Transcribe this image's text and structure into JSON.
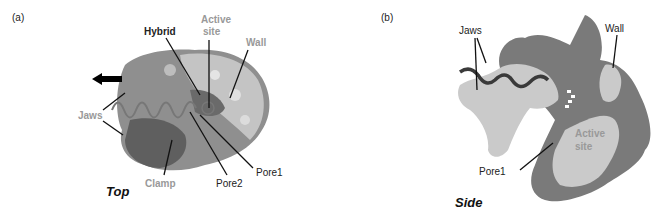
{
  "panel_a": {
    "tag": "(a)",
    "view": "Top",
    "labels": {
      "hybrid": "Hybrid",
      "active_site": "Active site",
      "active": "Active",
      "site": "site",
      "wall": "Wall",
      "jaws": "Jaws",
      "clamp": "Clamp",
      "pore2": "Pore2",
      "pore1": "Pore1"
    }
  },
  "panel_b": {
    "tag": "(b)",
    "view": "Side",
    "labels": {
      "jaws": "Jaws",
      "wall": "Wall",
      "active": "Active",
      "site": "site",
      "pore1": "Pore1"
    }
  },
  "colors": {
    "dark_region": "#6e6e6e",
    "light_region": "#c8c8c8",
    "mid_region": "#8a8a8a",
    "grey_label": "#9a9a9a",
    "line": "#111111"
  }
}
